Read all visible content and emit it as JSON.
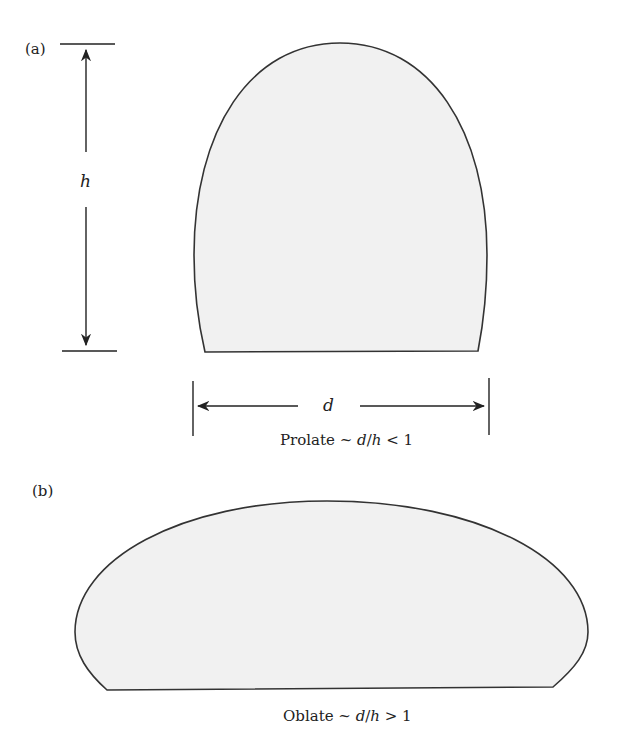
{
  "panel_a": {
    "label": "(a)",
    "height_symbol": "h",
    "width_symbol": "d",
    "caption": {
      "prefix": "Prolate ~ ",
      "d": "d",
      "slash": "/",
      "h": "h",
      "suffix": " < 1"
    }
  },
  "panel_b": {
    "label": "(b)",
    "caption": {
      "prefix": "Oblate ~ ",
      "d": "d",
      "slash": "/",
      "h": "h",
      "suffix": " > 1"
    }
  },
  "colors": {
    "shape_fill": "#f1f1f1",
    "stroke": "#333333",
    "text": "#222222"
  }
}
